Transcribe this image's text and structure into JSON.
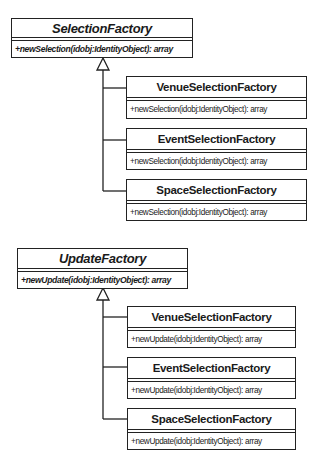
{
  "diagrams": [
    {
      "parent": {
        "name": "SelectionFactory",
        "operation": "+newSelection(idobj:IdentityObject): array",
        "abstract": true
      },
      "children": [
        {
          "name": "VenueSelectionFactory",
          "operation": "+newSelection(idobj:IdentityObject): array"
        },
        {
          "name": "EventSelectionFactory",
          "operation": "+newSelection(idobj:IdentityObject): array"
        },
        {
          "name": "SpaceSelectionFactory",
          "operation": "+newSelection(idobj:IdentityObject): array"
        }
      ]
    },
    {
      "parent": {
        "name": "UpdateFactory",
        "operation": "+newUpdate(idobj:IdentityObject): array",
        "abstract": true
      },
      "children": [
        {
          "name": "VenueSelectionFactory",
          "operation": "+newUpdate(idobj:IdentityObject): array"
        },
        {
          "name": "EventSelectionFactory",
          "operation": "+newUpdate(idobj:IdentityObject): array"
        },
        {
          "name": "SpaceSelectionFactory",
          "operation": "+newUpdate(idobj:IdentityObject): array"
        }
      ]
    }
  ],
  "relationship": "generalization"
}
